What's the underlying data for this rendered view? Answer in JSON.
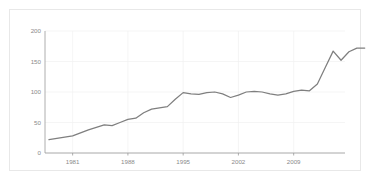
{
  "figure": {
    "background_color": "#ffffff",
    "border_color": "#e8e8e8"
  },
  "chart_data": {
    "type": "line",
    "title": "",
    "subtitle": "",
    "xlabel": "",
    "ylabel": "",
    "xlim": [
      1977.5,
      2015.5
    ],
    "ylim": [
      0,
      200
    ],
    "grid": true,
    "legend": false,
    "legend_position": "none",
    "line_color": "#7f7f7f",
    "axis_color": "#9a9a9a",
    "tick_label_color": "#8a8a8a",
    "grid_color": "#f0f0f0",
    "x_ticks": [
      1981,
      1988,
      1995,
      2002,
      2009
    ],
    "x_tick_labels": [
      "1981",
      "1988",
      "1995",
      "2002",
      "2009"
    ],
    "y_ticks": [
      0,
      50,
      100,
      150,
      200
    ],
    "y_tick_labels": [
      "0",
      "50",
      "100",
      "150",
      "200"
    ],
    "x": [
      1978,
      1979,
      1980,
      1981,
      1982,
      1983,
      1984,
      1985,
      1986,
      1987,
      1988,
      1989,
      1990,
      1991,
      1992,
      1993,
      1994,
      1995,
      1996,
      1997,
      1998,
      1999,
      2000,
      2001,
      2002,
      2003,
      2004,
      2005,
      2006,
      2007,
      2008,
      2009,
      2010,
      2011,
      2012,
      2013,
      2014,
      2015
    ],
    "values": [
      22,
      24,
      26,
      28,
      33,
      38,
      43,
      46,
      45,
      50,
      55,
      57,
      66,
      72,
      74,
      76,
      88,
      99,
      97,
      96,
      99,
      100,
      97,
      91,
      95,
      100,
      101,
      100,
      97,
      95,
      97,
      101,
      103,
      102,
      113,
      140,
      167,
      152
    ],
    "series": [
      {
        "name": "value",
        "color": "#7f7f7f",
        "points": [
          {
            "x": 1978,
            "y": 22
          },
          {
            "x": 1979,
            "y": 24
          },
          {
            "x": 1980,
            "y": 26
          },
          {
            "x": 1981,
            "y": 28
          },
          {
            "x": 1982,
            "y": 33
          },
          {
            "x": 1983,
            "y": 38
          },
          {
            "x": 1984,
            "y": 42
          },
          {
            "x": 1985,
            "y": 46
          },
          {
            "x": 1986,
            "y": 45
          },
          {
            "x": 1987,
            "y": 50
          },
          {
            "x": 1988,
            "y": 55
          },
          {
            "x": 1989,
            "y": 57
          },
          {
            "x": 1990,
            "y": 66
          },
          {
            "x": 1991,
            "y": 72
          },
          {
            "x": 1992,
            "y": 74
          },
          {
            "x": 1993,
            "y": 76
          },
          {
            "x": 1994,
            "y": 88
          },
          {
            "x": 1995,
            "y": 99
          },
          {
            "x": 1996,
            "y": 97
          },
          {
            "x": 1997,
            "y": 96
          },
          {
            "x": 1998,
            "y": 99
          },
          {
            "x": 1999,
            "y": 100
          },
          {
            "x": 2000,
            "y": 97
          },
          {
            "x": 2001,
            "y": 91
          },
          {
            "x": 2002,
            "y": 95
          },
          {
            "x": 2003,
            "y": 100
          },
          {
            "x": 2004,
            "y": 101
          },
          {
            "x": 2005,
            "y": 100
          },
          {
            "x": 2006,
            "y": 97
          },
          {
            "x": 2007,
            "y": 95
          },
          {
            "x": 2008,
            "y": 97
          },
          {
            "x": 2009,
            "y": 101
          },
          {
            "x": 2010,
            "y": 103
          },
          {
            "x": 2011,
            "y": 102
          },
          {
            "x": 2012,
            "y": 113
          },
          {
            "x": 2013,
            "y": 140
          },
          {
            "x": 2014,
            "y": 167
          },
          {
            "x": 2015,
            "y": 152
          },
          {
            "x": 2016,
            "y": 166
          },
          {
            "x": 2017,
            "y": 172
          },
          {
            "x": 2018,
            "y": 172
          }
        ]
      }
    ]
  }
}
